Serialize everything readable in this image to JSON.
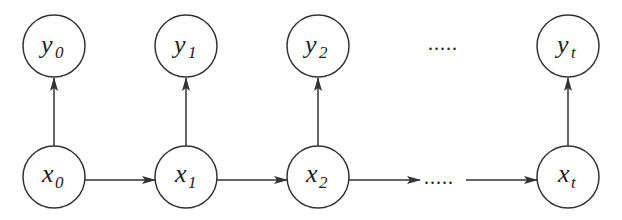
{
  "diagram": {
    "type": "hidden-markov-chain",
    "observed_nodes": [
      {
        "id": "y0",
        "base": "y",
        "sub": "0",
        "cx": 54,
        "cy": 46
      },
      {
        "id": "y1",
        "base": "y",
        "sub": "1",
        "cx": 186,
        "cy": 46
      },
      {
        "id": "y2",
        "base": "y",
        "sub": "2",
        "cx": 318,
        "cy": 46
      },
      {
        "id": "yt",
        "base": "y",
        "sub": "t",
        "cx": 568,
        "cy": 46
      }
    ],
    "hidden_nodes": [
      {
        "id": "x0",
        "base": "x",
        "sub": "0",
        "cx": 54,
        "cy": 177
      },
      {
        "id": "x1",
        "base": "x",
        "sub": "1",
        "cx": 186,
        "cy": 177
      },
      {
        "id": "x2",
        "base": "x",
        "sub": "2",
        "cx": 318,
        "cy": 177
      },
      {
        "id": "xt",
        "base": "x",
        "sub": "t",
        "cx": 568,
        "cy": 177
      }
    ],
    "top_ellipsis": ".....",
    "bottom_ellipsis": ".....",
    "edges": [
      {
        "from": "x0",
        "to": "x1"
      },
      {
        "from": "x1",
        "to": "x2"
      },
      {
        "from": "x2",
        "to": "..."
      },
      {
        "from": "...",
        "to": "xt"
      },
      {
        "from": "x0",
        "to": "y0"
      },
      {
        "from": "x1",
        "to": "y1"
      },
      {
        "from": "x2",
        "to": "y2"
      },
      {
        "from": "xt",
        "to": "yt"
      }
    ],
    "stroke_color": "#333333"
  }
}
